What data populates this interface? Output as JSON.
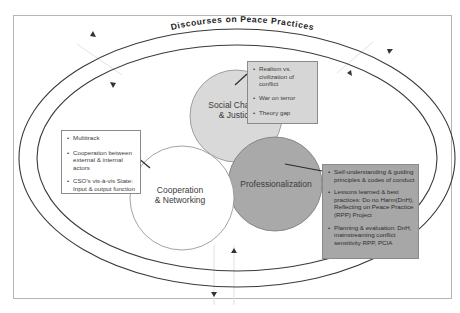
{
  "title": "Discourses on Peace Practices",
  "colors": {
    "frame": "#b5b5b5",
    "ellipse_stroke": "#3a3a3a",
    "social_change_fill": "#d9d9d9",
    "professionalization_fill": "#a9a9a9",
    "cooperation_fill": "#ffffff",
    "realism_box_fill": "#d6d6d6",
    "professionalization_box_fill": "#a7a7a7"
  },
  "circles": {
    "social_change": {
      "line1": "Social Change",
      "line2": "& Justice"
    },
    "cooperation": {
      "line1": "Cooperation",
      "line2": "& Networking"
    },
    "professionalization": {
      "label": "Professionalization"
    }
  },
  "boxes": {
    "social_change_box": {
      "items": [
        "Realism vs. civilization of conflict",
        "War on terror",
        "Theory gap"
      ]
    },
    "cooperation_box": {
      "items": [
        "Multitrack",
        "Cooperation between external & internal actors",
        "CSO's vis-à-vis State: Input & output function"
      ]
    },
    "professionalization_box": {
      "items": [
        "Self-understanding & guiding principles & codes of conduct",
        "Lessons learned & best practices: Do no Harm(DnH), Reflecting on Peace Practice (RPP) Project",
        "Planning & evaluation: DnH, mainstreaming conflict sensitivity RPP, PCIA"
      ]
    }
  },
  "arrows": [
    {
      "name": "top-left-outward",
      "direction": "outward"
    },
    {
      "name": "top-left-inward",
      "direction": "inward"
    },
    {
      "name": "top-right-outward",
      "direction": "outward"
    },
    {
      "name": "top-right-inward",
      "direction": "inward"
    },
    {
      "name": "bottom-inward",
      "direction": "inward"
    },
    {
      "name": "bottom-outward",
      "direction": "outward"
    }
  ]
}
